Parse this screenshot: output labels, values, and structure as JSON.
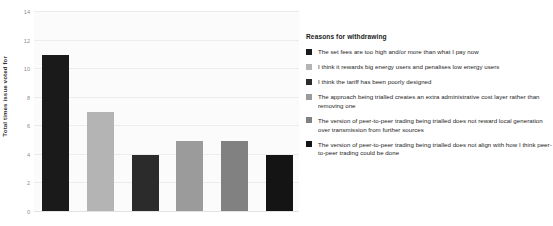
{
  "chart_data": {
    "type": "bar",
    "title": "",
    "xlabel": "",
    "ylabel": "Total times issue voted for",
    "ylim": [
      0,
      14
    ],
    "yticks": [
      0,
      2,
      4,
      6,
      8,
      10,
      12,
      14
    ],
    "grid": true,
    "categories": [
      "The set fees are too high and/or more than what I pay now",
      "I think it rewards big energy users and penalises low energy users",
      "I think the tariff has been poorly designed",
      "The approach being trialled creates an extra administrative cost layer rather than removing one",
      "The version of peer-to-peer trading being trialled does not reward local generation over transmission from further sources",
      "The version of peer-to-peer trading being trialled does not align with how I think peer-to-peer trading could be done"
    ],
    "values": [
      11,
      7,
      4,
      5,
      5,
      4
    ],
    "colors": [
      "#1a1a1a",
      "#b4b4b4",
      "#2b2b2b",
      "#9b9b9b",
      "#818181",
      "#141414"
    ],
    "legend_position": "right",
    "legend_title": "Reasons for withdrawing"
  },
  "legend": {
    "title": "Reasons for withdrawing",
    "items": [
      {
        "color": "#1a1a1a",
        "label": "The set fees are too high and/or more than what I pay now"
      },
      {
        "color": "#b4b4b4",
        "label": "I think it rewards big energy users and penalises low energy users"
      },
      {
        "color": "#2b2b2b",
        "label": "I think the tariff has been poorly designed"
      },
      {
        "color": "#9b9b9b",
        "label": "The approach being trialled creates an extra administrative cost layer rather than removing one"
      },
      {
        "color": "#818181",
        "label": "The version of peer-to-peer trading being trialled does not reward local generation over transmission from further sources"
      },
      {
        "color": "#141414",
        "label": "The version of peer-to-peer trading being trialled does not align with how I think peer-to-peer trading could be done"
      }
    ]
  },
  "axes": {
    "y_title": "Total times issue voted for",
    "y_tick_labels": [
      "0",
      "2",
      "4",
      "6",
      "8",
      "10",
      "12",
      "14"
    ]
  }
}
